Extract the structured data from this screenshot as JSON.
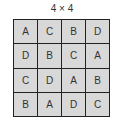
{
  "title": "4 × 4",
  "grid": {
    "rows": [
      [
        "A",
        "C",
        "B",
        "D"
      ],
      [
        "D",
        "B",
        "C",
        "A"
      ],
      [
        "C",
        "D",
        "A",
        "B"
      ],
      [
        "B",
        "A",
        "D",
        "C"
      ]
    ]
  },
  "colors": {
    "cell_fill": "#d8d8d8",
    "border": "#222222",
    "text": "#333333"
  }
}
